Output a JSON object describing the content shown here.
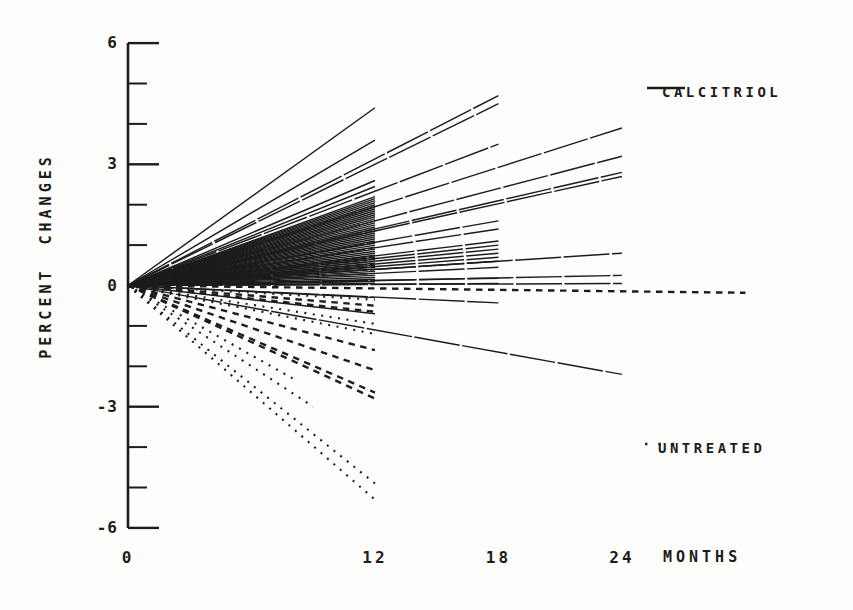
{
  "figure": {
    "background": "#fdfdfb",
    "ink": "#1c1c1c",
    "kind": "scanned journal figure, fan plot of individual regression slopes"
  },
  "legend": {
    "calcitriol_label": "CALCITRIOL",
    "untreated_label": "UNTREATED"
  },
  "chart_data": {
    "type": "line",
    "title": "",
    "xlabel": "MONTHS",
    "ylabel": "PERCENT CHANGES",
    "x_ticks": [
      0,
      12,
      18,
      24
    ],
    "x_tick_labels": [
      "0",
      "12",
      "18",
      "24"
    ],
    "y_ticks_major": [
      6,
      3,
      0,
      -3,
      -6
    ],
    "y_tick_labels": [
      "6",
      "3",
      "0",
      "-3",
      "-6"
    ],
    "y_ticks_minor": [
      5,
      4,
      2,
      1,
      -1,
      -2,
      -4,
      -5
    ],
    "xlim": [
      0,
      30.5
    ],
    "ylim": [
      -6,
      6
    ],
    "grid": false,
    "legend_position": "right",
    "series": [
      {
        "name": "CALCITRIOL",
        "style": "solid",
        "lines": [
          [
            12,
            4.4
          ],
          [
            12,
            3.6
          ],
          [
            12,
            2.6
          ],
          [
            12,
            2.45
          ],
          [
            12,
            2.2
          ],
          [
            12,
            2.15
          ],
          [
            12,
            2.1
          ],
          [
            12,
            2.05
          ],
          [
            12,
            2.0
          ],
          [
            12,
            1.95
          ],
          [
            12,
            1.9
          ],
          [
            12,
            1.85
          ],
          [
            12,
            1.8
          ],
          [
            12,
            1.75
          ],
          [
            12,
            1.7
          ],
          [
            12,
            1.65
          ],
          [
            12,
            1.6
          ],
          [
            12,
            1.55
          ],
          [
            12,
            1.5
          ],
          [
            12,
            1.45
          ],
          [
            12,
            1.4
          ],
          [
            12,
            1.35
          ],
          [
            12,
            1.3
          ],
          [
            12,
            1.25
          ],
          [
            12,
            1.2
          ],
          [
            12,
            1.15
          ],
          [
            12,
            1.1
          ],
          [
            12,
            1.05
          ],
          [
            12,
            1.0
          ],
          [
            12,
            0.95
          ],
          [
            12,
            0.9
          ],
          [
            12,
            0.85
          ],
          [
            12,
            0.8
          ],
          [
            12,
            0.75
          ],
          [
            12,
            0.7
          ],
          [
            12,
            0.65
          ],
          [
            12,
            0.6
          ],
          [
            12,
            0.55
          ],
          [
            12,
            0.5
          ],
          [
            12,
            0.45
          ],
          [
            12,
            0.4
          ],
          [
            12,
            0.35
          ],
          [
            12,
            0.3
          ],
          [
            12,
            0.25
          ],
          [
            12,
            0.2
          ],
          [
            12,
            0.15
          ],
          [
            12,
            0.1
          ],
          [
            12,
            0.05
          ],
          [
            12,
            -0.3
          ],
          [
            12,
            -0.7
          ],
          [
            18,
            4.7
          ],
          [
            18,
            4.5
          ],
          [
            18,
            3.5
          ],
          [
            18,
            1.6
          ],
          [
            18,
            1.4
          ],
          [
            18,
            1.1
          ],
          [
            18,
            1.0
          ],
          [
            18,
            0.9
          ],
          [
            18,
            0.8
          ],
          [
            18,
            0.7
          ],
          [
            18,
            0.6
          ],
          [
            18,
            0.45
          ],
          [
            18,
            0.18
          ],
          [
            18,
            0.05
          ],
          [
            18,
            -0.43
          ],
          [
            24,
            3.9
          ],
          [
            24,
            3.2
          ],
          [
            24,
            2.8
          ],
          [
            24,
            2.7
          ],
          [
            24,
            0.8
          ],
          [
            24,
            0.25
          ],
          [
            24,
            0.05
          ],
          [
            24,
            -2.2
          ]
        ]
      },
      {
        "name": "UNTREATED",
        "style": "dotted",
        "lines": [
          [
            12,
            -0.35
          ],
          [
            12,
            -0.95
          ],
          [
            12,
            -1.2
          ],
          [
            8,
            -2.3
          ],
          [
            9,
            -3.0
          ],
          [
            12,
            -4.9
          ],
          [
            12,
            -5.3
          ]
        ]
      },
      {
        "name": "UNTREATED",
        "style": "dashed",
        "lines": [
          [
            12,
            -0.5
          ],
          [
            12,
            -0.65
          ],
          [
            12,
            -1.6
          ],
          [
            12,
            -2.1
          ],
          [
            12,
            -2.65
          ],
          [
            12,
            -2.8
          ],
          [
            30,
            -0.18
          ]
        ]
      }
    ]
  }
}
